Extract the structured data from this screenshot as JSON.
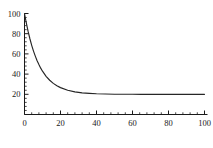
{
  "chart_data": {
    "type": "line",
    "title": "",
    "subtitle": "",
    "xlabel": "",
    "ylabel": "",
    "xlim": [
      0,
      100
    ],
    "ylim": [
      0,
      100
    ],
    "grid": false,
    "legend": false,
    "legend_position": "none",
    "background_color": "#ffffff",
    "line_color": "#262626",
    "axis_color": "#1a1a1a",
    "x_ticks": [
      0,
      20,
      40,
      60,
      80,
      100
    ],
    "x_tick_labels": [
      "0",
      "20",
      "40",
      "60",
      "80",
      "100"
    ],
    "x_minor_tick_step": 4,
    "y_ticks": [
      20,
      40,
      60,
      80,
      100
    ],
    "y_tick_labels": [
      "20",
      "40",
      "60",
      "80",
      "100"
    ],
    "y_minor_tick_step": 4,
    "annotations": [],
    "series": [
      {
        "name": "exponential decay",
        "asymptote": 20,
        "initial_value": 100,
        "x": [
          0,
          1,
          2,
          3,
          4,
          5,
          6,
          7,
          8,
          9,
          10,
          12,
          14,
          16,
          18,
          20,
          24,
          28,
          32,
          36,
          40,
          45,
          50,
          55,
          60,
          65,
          70,
          75,
          80,
          85,
          90,
          95,
          100
        ],
        "values": [
          100,
          90.6,
          82.3,
          75,
          68.5,
          62.8,
          57.8,
          53.3,
          49.4,
          45.9,
          42.9,
          37.8,
          33.9,
          30.8,
          28.5,
          26.6,
          24,
          22.4,
          21.4,
          20.9,
          20.5,
          20.3,
          20.1,
          20.1,
          20.0,
          20.0,
          20.0,
          20.0,
          20.0,
          20.0,
          20.0,
          20.0,
          20.0
        ]
      }
    ]
  },
  "figure": {
    "name": "exponential-decay-plot"
  }
}
